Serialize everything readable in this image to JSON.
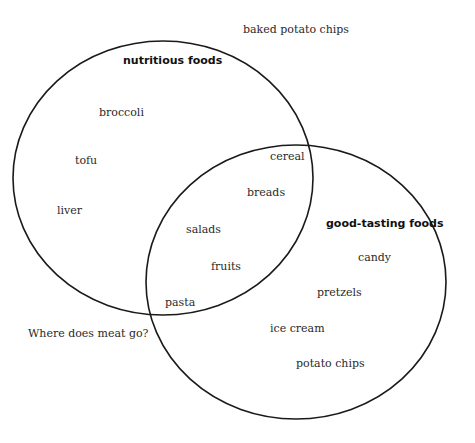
{
  "diagram": {
    "type": "venn",
    "sets": [
      {
        "name": "nutritious foods",
        "items": [
          "broccoli",
          "tofu",
          "liver"
        ]
      },
      {
        "name": "good-tasting foods",
        "items": [
          "candy",
          "pretzels",
          "ice cream",
          "potato chips"
        ]
      }
    ],
    "intersection": [
      "cereal",
      "breads",
      "salads",
      "fruits",
      "pasta"
    ],
    "outside": [
      "baked potato chips",
      "Where does meat go?"
    ],
    "colors": {
      "stroke": "#1a1a1a",
      "text": "#2a2a2a",
      "background": "#ffffff"
    }
  },
  "labels": {
    "set_a_title": "nutritious foods",
    "set_b_title": "good-tasting foods",
    "broccoli": "broccoli",
    "tofu": "tofu",
    "liver": "liver",
    "cereal": "cereal",
    "breads": "breads",
    "salads": "salads",
    "fruits": "fruits",
    "pasta": "pasta",
    "candy": "candy",
    "pretzels": "pretzels",
    "ice_cream": "ice cream",
    "potato_chips": "potato chips",
    "baked_potato_chips": "baked potato chips",
    "meat_question": "Where does meat go?"
  }
}
